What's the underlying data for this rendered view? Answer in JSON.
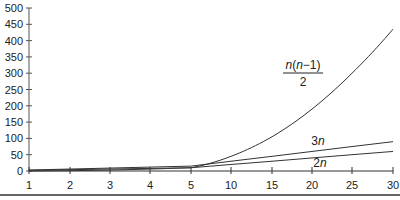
{
  "chart_data": {
    "type": "line",
    "title": "",
    "xlabel": "",
    "ylabel": "",
    "x": [
      1,
      2,
      3,
      4,
      5,
      10,
      15,
      20,
      25,
      30
    ],
    "x_tick_labels": [
      "1",
      "2",
      "3",
      "4",
      "5",
      "10",
      "15",
      "20",
      "25",
      "30"
    ],
    "y_ticks": [
      0,
      50,
      100,
      150,
      200,
      250,
      300,
      350,
      400,
      450,
      500
    ],
    "y_tick_labels": [
      "0",
      "50",
      "100",
      "150",
      "200",
      "250",
      "300",
      "350",
      "400",
      "450",
      "500"
    ],
    "ylim": [
      0,
      500
    ],
    "grid": false,
    "legend": "inline labels",
    "series": [
      {
        "name": "n(n-1)/2",
        "label_num": "n(n−1)",
        "label_den": "2",
        "values": [
          0,
          1,
          3,
          6,
          10,
          45,
          105,
          190,
          300,
          435
        ]
      },
      {
        "name": "3n",
        "label_num": "3",
        "label_var": "n",
        "values": [
          3,
          6,
          9,
          12,
          15,
          30,
          45,
          60,
          75,
          90
        ]
      },
      {
        "name": "2n",
        "label_num": "2",
        "label_var": "n",
        "values": [
          2,
          4,
          6,
          8,
          10,
          20,
          30,
          40,
          50,
          60
        ]
      }
    ]
  }
}
